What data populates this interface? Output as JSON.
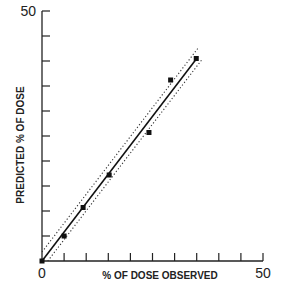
{
  "chart_data": {
    "type": "scatter",
    "title": "",
    "xlabel": "% OF DOSE OBSERVED",
    "ylabel": "PREDICTED % OF DOSE",
    "xlim": [
      0,
      50
    ],
    "ylim": [
      0,
      50
    ],
    "x_tick_step": 5,
    "y_tick_step": 5,
    "x_tick_labels": [
      {
        "value": 0,
        "label": "0"
      },
      {
        "value": 50,
        "label": "50"
      }
    ],
    "y_tick_labels": [
      {
        "value": 50,
        "label": "50"
      }
    ],
    "grid": false,
    "legend": null,
    "series": [
      {
        "name": "observations",
        "marker": "square",
        "points": [
          {
            "x": 0,
            "y": 0
          },
          {
            "x": 5,
            "y": 5
          },
          {
            "x": 9.3,
            "y": 10.7
          },
          {
            "x": 15.2,
            "y": 17.2
          },
          {
            "x": 24.2,
            "y": 25.7
          },
          {
            "x": 29.1,
            "y": 36.2
          },
          {
            "x": 34.9,
            "y": 40.5
          }
        ]
      }
    ],
    "fit_line": {
      "name": "regression",
      "style": "solid",
      "x": [
        0,
        35
      ],
      "y": [
        0,
        40.5
      ]
    },
    "confidence_bands": [
      {
        "name": "upper-bound",
        "style": "dotted",
        "x": [
          0,
          35.5
        ],
        "y": [
          1.8,
          42.8
        ]
      },
      {
        "name": "lower-bound",
        "style": "dotted",
        "x": [
          1.3,
          36.2
        ],
        "y": [
          0,
          40.3
        ]
      }
    ]
  }
}
